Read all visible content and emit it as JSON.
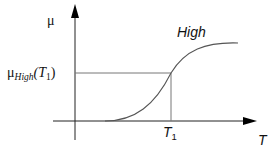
{
  "diagram": {
    "type": "membership-function",
    "y_axis_label": "μ",
    "x_axis_label": "T",
    "curve_label": "High",
    "y_marker_label": {
      "base": "μ",
      "subscript": "High",
      "arg": "(T",
      "arg_sub": "1",
      "close": ")"
    },
    "x_marker_label": {
      "base": "T",
      "subscript": "1"
    },
    "colors": {
      "axis": "#000000",
      "curve": "#555555",
      "guide": "#666666",
      "text": "#111111"
    }
  }
}
